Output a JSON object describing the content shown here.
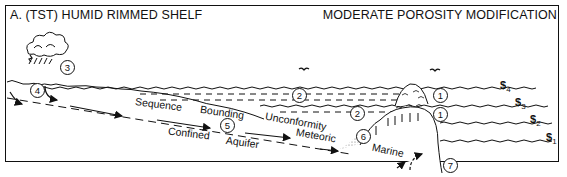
{
  "panel": {
    "title_left": "A.  (TST) HUMID RIMMED SHELF",
    "title_right": "MODERATE POROSITY MODIFICATION"
  },
  "labels": {
    "sequence": "Sequence",
    "bounding": "Bounding",
    "unconformity": "Unconformity",
    "confined": "Confined",
    "aquifer": "Aquifer",
    "meteoric": "Meteoric",
    "marine": "Marine"
  },
  "callouts": [
    {
      "id": "c1a",
      "text": "1"
    },
    {
      "id": "c1b",
      "text": "1"
    },
    {
      "id": "c2a",
      "text": "2"
    },
    {
      "id": "c2b",
      "text": "2"
    },
    {
      "id": "c3",
      "text": "3"
    },
    {
      "id": "c4",
      "text": "4"
    },
    {
      "id": "c5",
      "text": "5"
    },
    {
      "id": "c6",
      "text": "6"
    },
    {
      "id": "c7",
      "text": "7"
    }
  ],
  "sea_levels": [
    {
      "symbol": "$",
      "sub": "4"
    },
    {
      "symbol": "$",
      "sub": "3"
    },
    {
      "symbol": "$",
      "sub": "2"
    },
    {
      "symbol": "$",
      "sub": "1"
    }
  ],
  "icons": [
    "cloud-rain-icon",
    "bird-icon",
    "bird-icon",
    "arrow-icon"
  ]
}
